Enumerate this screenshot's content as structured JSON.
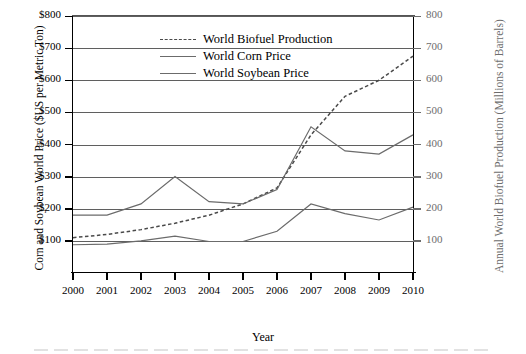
{
  "chart_data": {
    "type": "line",
    "title": "",
    "xlabel": "Year",
    "ylabel": "Corn and Soybean World Price ($US per Metric Ton)",
    "y2label": "Annual World Biofuel Production (Millions of Barrels)",
    "x": [
      2000,
      2001,
      2002,
      2003,
      2004,
      2005,
      2006,
      2007,
      2008,
      2009,
      2010
    ],
    "categories": [
      "2000",
      "2001",
      "2002",
      "2003",
      "2004",
      "2005",
      "2006",
      "2007",
      "2008",
      "2009",
      "2010"
    ],
    "xlim": [
      2000,
      2010
    ],
    "ylim": [
      0,
      800
    ],
    "y2lim": [
      0,
      800
    ],
    "yticks": [
      "$100",
      "$200",
      "$300",
      "$400",
      "$500",
      "$600",
      "$700",
      "$800"
    ],
    "ytick_values": [
      100,
      200,
      300,
      400,
      500,
      600,
      700,
      800
    ],
    "y2ticks": [
      "100",
      "200",
      "300",
      "400",
      "500",
      "600",
      "700",
      "800"
    ],
    "y2tick_values": [
      100,
      200,
      300,
      400,
      500,
      600,
      700,
      800
    ],
    "grid": true,
    "legend_position": "upper-center-left",
    "series": [
      {
        "name": "World Biofuel Production",
        "axis": "right",
        "style": "dashed",
        "color": "#4a4a4a",
        "values": [
          110,
          120,
          135,
          155,
          180,
          215,
          265,
          430,
          550,
          600,
          675
        ]
      },
      {
        "name": "World Corn Price",
        "axis": "left",
        "style": "solid",
        "color": "#6b6b6b",
        "values": [
          88,
          90,
          100,
          115,
          98,
          98,
          130,
          215,
          185,
          165,
          205
        ]
      },
      {
        "name": "World Soybean Price",
        "axis": "left",
        "style": "solid",
        "color": "#6b6b6b",
        "values": [
          180,
          180,
          215,
          300,
          222,
          215,
          260,
          455,
          380,
          370,
          430
        ]
      }
    ]
  },
  "legend": {
    "items": [
      {
        "label": "World Biofuel Production",
        "style": "dashed"
      },
      {
        "label": "World Corn Price",
        "style": "solid"
      },
      {
        "label": "World Soybean Price",
        "style": "solid"
      }
    ]
  },
  "axes": {
    "x_title": "Year",
    "y_left_title": "Corn and Soybean World Price ($US per Metric Ton)",
    "y_right_title": "Annual World Biofuel Production (Millions of Barrels)"
  },
  "colors": {
    "axis": "#000000",
    "grid": "#5f5f5f",
    "series_line": "#6b6b6b",
    "dashed_line": "#4a4a4a",
    "right_axis_text": "#6d6d6d"
  }
}
